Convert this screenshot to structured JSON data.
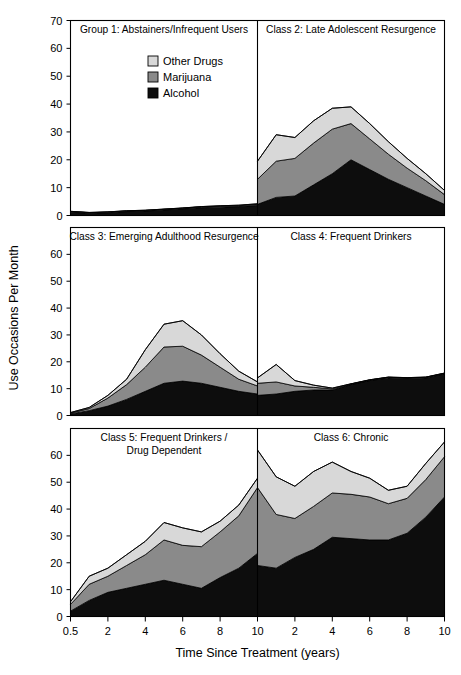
{
  "figure": {
    "ylabel": "Use Occasions Per Month",
    "xlabel": "Time Since Treatment (years)"
  },
  "legend": {
    "position": "top-center-left-panel",
    "items": [
      {
        "label": "Other Drugs",
        "color": "#d8d8d8"
      },
      {
        "label": "Marijuana",
        "color": "#8a8a8a"
      },
      {
        "label": "Alcohol",
        "color": "#0d0d0d"
      }
    ]
  },
  "axes": {
    "ylim": [
      0,
      70
    ],
    "yticks_top_row": [
      0,
      10,
      20,
      30,
      40,
      50,
      60,
      70
    ],
    "yticks_other_rows": [
      0,
      10,
      20,
      30,
      40,
      50,
      60
    ],
    "xtick_labels": [
      "0.5",
      "2",
      "4",
      "6",
      "8",
      "10",
      "2",
      "4",
      "6",
      "8",
      "10"
    ],
    "grid": false
  },
  "chart_data": {
    "type": "area",
    "title": "",
    "subtitle": "",
    "xlabel": "Time Since Treatment (years)",
    "ylabel": "Use Occasions Per Month",
    "ylim": [
      0,
      70
    ],
    "stacked": true,
    "x": [
      0.5,
      2,
      4,
      6,
      8,
      10,
      12,
      14,
      16,
      18,
      20
    ],
    "x_tick_labels": [
      "0.5",
      "2",
      "4",
      "6",
      "8",
      "10",
      "2",
      "4",
      "6",
      "8",
      "10"
    ],
    "legend": [
      "Other Drugs",
      "Marijuana",
      "Alcohol"
    ],
    "legend_position": "upper-left-panel",
    "panels": [
      {
        "id": "group1",
        "title": "Group 1: Abstainers/Infrequent Users",
        "row": 0,
        "col": 0,
        "series": [
          {
            "name": "Alcohol",
            "values": [
              1.2,
              0.8,
              1.0,
              1.4,
              1.6,
              2.0,
              2.4,
              2.8,
              3.0,
              3.2,
              3.6
            ]
          },
          {
            "name": "Marijuana",
            "values": [
              0.2,
              0.2,
              0.2,
              0.2,
              0.2,
              0.2,
              0.2,
              0.3,
              0.3,
              0.3,
              0.4
            ]
          },
          {
            "name": "Other Drugs",
            "values": [
              0.1,
              0.1,
              0.1,
              0.1,
              0.1,
              0.1,
              0.1,
              0.1,
              0.2,
              0.2,
              0.2
            ]
          }
        ],
        "totals": [
          1.5,
          1.1,
          1.3,
          1.7,
          1.9,
          2.3,
          2.7,
          3.2,
          3.5,
          3.7,
          4.2
        ]
      },
      {
        "id": "class2",
        "title": "Class 2: Late Adolescent Resurgence",
        "row": 0,
        "col": 1,
        "series": [
          {
            "name": "Alcohol",
            "values": [
              4.0,
              6.5,
              7.0,
              11.0,
              15.0,
              20.0,
              16.5,
              13.0,
              10.0,
              7.0,
              4.0
            ]
          },
          {
            "name": "Marijuana",
            "values": [
              9.0,
              13.0,
              13.5,
              15.0,
              16.0,
              13.0,
              11.0,
              9.0,
              7.0,
              5.5,
              3.5
            ]
          },
          {
            "name": "Other Drugs",
            "values": [
              6.5,
              9.5,
              7.5,
              8.0,
              7.5,
              6.0,
              5.5,
              4.5,
              3.5,
              2.5,
              1.5
            ]
          }
        ],
        "totals": [
          19.5,
          29.0,
          28.0,
          34.0,
          38.5,
          39.0,
          33.0,
          26.5,
          20.5,
          15.0,
          9.0
        ]
      },
      {
        "id": "class3",
        "title": "Class 3: Emerging Adulthood Resurgence",
        "row": 1,
        "col": 0,
        "series": [
          {
            "name": "Alcohol",
            "values": [
              0.6,
              1.8,
              3.5,
              6.0,
              9.0,
              12.0,
              12.8,
              12.0,
              10.5,
              9.0,
              8.0
            ]
          },
          {
            "name": "Marijuana",
            "values": [
              0.3,
              0.8,
              3.0,
              5.5,
              9.0,
              13.5,
              13.0,
              10.5,
              7.5,
              4.5,
              3.0
            ]
          },
          {
            "name": "Other Drugs",
            "values": [
              0.2,
              0.4,
              1.0,
              2.0,
              6.5,
              8.5,
              9.5,
              7.5,
              5.0,
              3.0,
              1.5
            ]
          }
        ],
        "totals": [
          1.1,
          3.0,
          7.5,
          13.5,
          24.5,
          34.0,
          35.3,
          30.0,
          23.0,
          16.5,
          12.5
        ]
      },
      {
        "id": "class4",
        "title": "Class 4: Frequent Drinkers",
        "row": 1,
        "col": 1,
        "series": [
          {
            "name": "Alcohol",
            "values": [
              7.5,
              8.0,
              9.0,
              9.5,
              9.5,
              11.5,
              13.0,
              14.0,
              13.8,
              14.0,
              15.5
            ]
          },
          {
            "name": "Marijuana",
            "values": [
              4.5,
              4.5,
              2.0,
              1.0,
              0.4,
              0.2,
              0.2,
              0.2,
              0.2,
              0.2,
              0.2
            ]
          },
          {
            "name": "Other Drugs",
            "values": [
              2.0,
              6.5,
              2.0,
              0.8,
              0.3,
              0.1,
              0.1,
              0.1,
              0.1,
              0.1,
              0.1
            ]
          }
        ],
        "totals": [
          14.0,
          19.0,
          13.0,
          11.3,
          10.2,
          11.8,
          13.3,
          14.3,
          14.1,
          14.3,
          15.8
        ]
      },
      {
        "id": "class5",
        "title": "Class 5: Frequent Drinkers / Drug Dependent",
        "title_lines": [
          "Class 5: Frequent Drinkers /",
          "Drug Dependent"
        ],
        "row": 2,
        "col": 0,
        "series": [
          {
            "name": "Alcohol",
            "values": [
              2.0,
              6.0,
              9.0,
              10.5,
              12.0,
              13.5,
              12.0,
              10.5,
              14.5,
              18.0,
              23.5
            ]
          },
          {
            "name": "Marijuana",
            "values": [
              2.5,
              6.0,
              6.0,
              8.5,
              11.0,
              15.0,
              14.5,
              15.5,
              17.0,
              19.5,
              24.5
            ]
          },
          {
            "name": "Other Drugs",
            "values": [
              1.0,
              3.0,
              3.0,
              4.0,
              5.0,
              6.5,
              6.5,
              5.5,
              4.0,
              4.0,
              3.5
            ]
          }
        ],
        "totals": [
          5.5,
          15.0,
          18.0,
          23.0,
          28.0,
          35.0,
          33.0,
          31.5,
          35.5,
          41.5,
          51.5
        ]
      },
      {
        "id": "class6",
        "title": "Class 6: Chronic",
        "row": 2,
        "col": 1,
        "series": [
          {
            "name": "Alcohol",
            "values": [
              19.0,
              18.0,
              22.0,
              25.0,
              29.5,
              29.0,
              28.5,
              28.5,
              31.0,
              37.0,
              44.5
            ]
          },
          {
            "name": "Marijuana",
            "values": [
              29.0,
              20.0,
              14.5,
              16.0,
              16.5,
              16.5,
              16.0,
              13.5,
              13.0,
              14.0,
              15.0
            ]
          },
          {
            "name": "Other Drugs",
            "values": [
              14.0,
              14.0,
              12.0,
              13.0,
              11.5,
              8.5,
              7.0,
              5.0,
              4.5,
              6.0,
              5.5
            ]
          }
        ],
        "totals": [
          62.0,
          52.0,
          48.5,
          54.0,
          57.5,
          54.0,
          51.5,
          47.0,
          48.5,
          57.0,
          65.0
        ]
      }
    ]
  }
}
